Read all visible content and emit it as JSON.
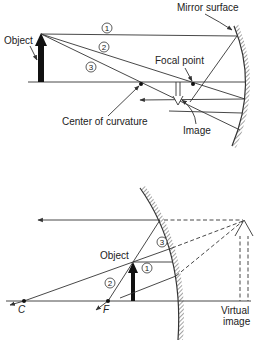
{
  "figure_top": {
    "title": "Concave mirror: real image",
    "labels": {
      "mirror_surface": "Mirror surface",
      "object": "Object",
      "focal_point": "Focal point",
      "center_of_curvature": "Center of curvature",
      "image": "Image"
    },
    "ray_numbers": [
      "1",
      "2",
      "3"
    ]
  },
  "figure_bottom": {
    "title": "Concave mirror: virtual image",
    "labels": {
      "object": "Object",
      "c": "C",
      "f": "F",
      "virtual_image_line1": "Virtual",
      "virtual_image_line2": "image"
    },
    "ray_numbers": [
      "1",
      "2",
      "3"
    ]
  },
  "colors": {
    "ink": "#222222",
    "background": "#ffffff"
  }
}
